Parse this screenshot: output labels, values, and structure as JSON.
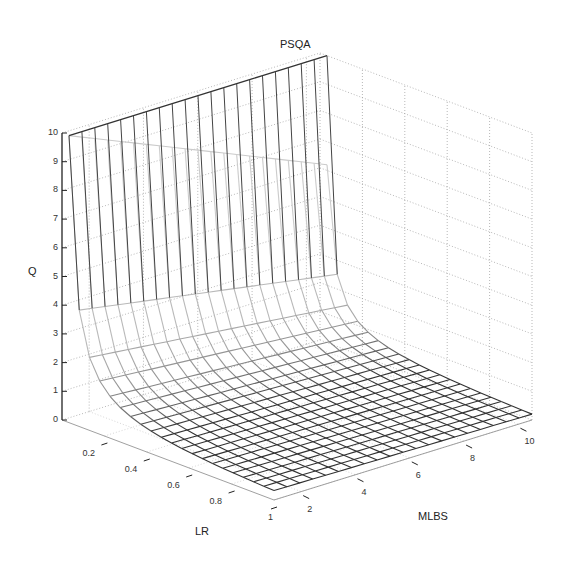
{
  "chart_data": {
    "type": "surface",
    "title": "PSQA",
    "xlabel": "LR",
    "ylabel": "MLBS",
    "zlabel": "Q",
    "x_range": [
      0.05,
      1
    ],
    "y_range": [
      1,
      10.5
    ],
    "z_range": [
      0,
      10
    ],
    "x_ticks": [
      "0.2",
      "0.4",
      "0.6",
      "0.8",
      "1"
    ],
    "y_ticks": [
      "2",
      "4",
      "6",
      "8",
      "10"
    ],
    "z_ticks": [
      "0",
      "1",
      "2",
      "3",
      "4",
      "5",
      "6",
      "7",
      "8",
      "9",
      "10"
    ],
    "grid": true,
    "mesh": {
      "x_lines": 20,
      "y_lines": 20
    },
    "sample_values": [
      {
        "LR": 0.05,
        "MLBS": 1,
        "Q": 10
      },
      {
        "LR": 0.1,
        "MLBS": 1,
        "Q": 3.5
      },
      {
        "LR": 0.2,
        "MLBS": 1,
        "Q": 1.8
      },
      {
        "LR": 0.5,
        "MLBS": 1,
        "Q": 0.7
      },
      {
        "LR": 1.0,
        "MLBS": 1,
        "Q": 0.35
      },
      {
        "LR": 0.05,
        "MLBS": 10.5,
        "Q": 10
      },
      {
        "LR": 1.0,
        "MLBS": 10.5,
        "Q": 0.2
      }
    ],
    "colors": {
      "mesh_dark": "#333333",
      "mesh_light": "#d8d8d8",
      "grid": "#999999",
      "axis": "#222222"
    }
  }
}
